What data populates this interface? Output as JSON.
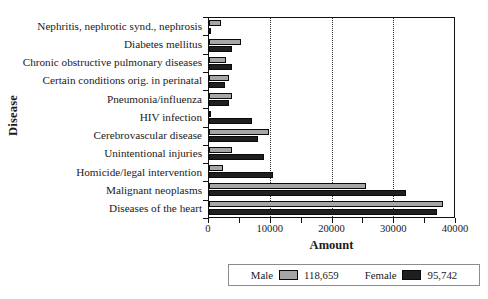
{
  "chart_data": {
    "type": "bar",
    "orientation": "horizontal",
    "title": "",
    "xlabel": "Amount",
    "ylabel": "Disease",
    "xlim": [
      0,
      40000
    ],
    "xticks": [
      0,
      5000,
      10000,
      15000,
      20000,
      25000,
      30000,
      35000,
      40000
    ],
    "xtick_labels": [
      "0",
      "10000",
      "20000",
      "30000",
      "40000"
    ],
    "labeled_xticks": [
      0,
      10000,
      20000,
      30000,
      40000
    ],
    "gridlines": [
      10000,
      20000,
      30000
    ],
    "grid": true,
    "grid_style": "dotted-vertical",
    "legend_position": "bottom-center",
    "categories": [
      "Nephritis, nephrotic synd., nephrosis",
      "Diabetes mellitus",
      "Chronic obstructive pulmonary diseases",
      "Certain conditions orig. in perinatal",
      "Pneumonia/influenza",
      "HIV infection",
      "Cerebrovascular disease",
      "Unintentional injuries",
      "Homicide/legal intervention",
      "Malignant neoplasms",
      "Diseases of the heart"
    ],
    "series": [
      {
        "name": "Male",
        "color": "#a6a6a6",
        "total": "118,659",
        "values": [
          2000,
          5200,
          2700,
          3300,
          3700,
          400,
          9800,
          3700,
          2300,
          25700,
          38200
        ]
      },
      {
        "name": "Female",
        "color": "#1f1f1f",
        "total": "95,742",
        "values": [
          200,
          3800,
          3800,
          2600,
          3200,
          7100,
          8000,
          8900,
          10500,
          32200,
          37300
        ]
      }
    ]
  },
  "legend": {
    "entries": [
      {
        "label": "Male",
        "value": "118,659",
        "swatch": "male"
      },
      {
        "label": "Female",
        "value": "95,742",
        "swatch": "female"
      }
    ]
  },
  "axes": {
    "x_title": "Amount",
    "y_title": "Disease"
  }
}
